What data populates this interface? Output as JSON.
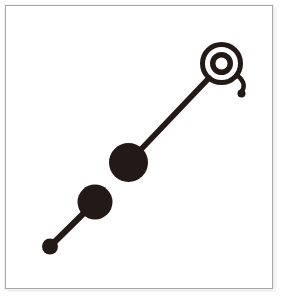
{
  "figure": {
    "title": "Ink diagram of linked discs and bullseye",
    "background_color": "#ffffff",
    "ink_color": "#231a18",
    "frame": {
      "border_color": "#a7a7a7",
      "fill_color": "#ffffff",
      "x": 5,
      "y": 5,
      "width": 268,
      "height": 284,
      "stroke_width": 1
    },
    "shapes": {
      "bullseye": {
        "label": "bullseye",
        "center_x": 221.5,
        "center_y": 63.5,
        "outer_radius": 21.5,
        "ring_gap_radius": 16.5,
        "inner_ring_radius": 11.5,
        "core_radius": 6.0,
        "ring_stroke": 5.0
      },
      "tail": {
        "label": "curled-tail",
        "path": "M 238 76 C 245 82 245 88 241 92",
        "stroke_width": 4.5,
        "end_dot_x": 241.5,
        "end_dot_y": 93.5,
        "end_dot_radius": 4.0
      },
      "upper_link": {
        "label": "upper-connector",
        "x1": 128.5,
        "y1": 162.5,
        "x2": 209.0,
        "y2": 78.0,
        "stroke_width": 5.5
      },
      "middle_disc": {
        "label": "middle-disc",
        "center_x": 128.5,
        "center_y": 162.5,
        "radius": 19.5
      },
      "lower_disc": {
        "label": "lower-disc",
        "center_x": 95.0,
        "center_y": 202.0,
        "radius": 17.5
      },
      "lower_link": {
        "label": "lower-connector",
        "x1": 50.0,
        "y1": 246.5,
        "x2": 88.0,
        "y2": 209.0,
        "stroke_width": 6.0
      },
      "small_dot": {
        "label": "small-dot",
        "center_x": 50.0,
        "center_y": 246.5,
        "radius": 8.0
      }
    }
  }
}
